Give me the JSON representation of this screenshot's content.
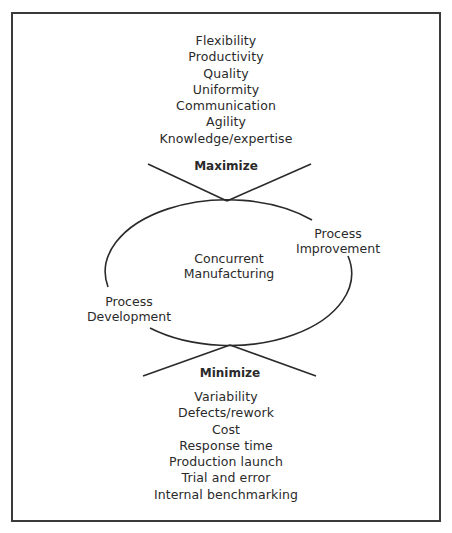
{
  "diagram": {
    "maximize_label": "Maximize",
    "minimize_label": "Minimize",
    "center": {
      "line1": "Concurrent",
      "line2": "Manufacturing"
    },
    "process_improvement": {
      "line1": "Process",
      "line2": "Improvement"
    },
    "process_development": {
      "line1": "Process",
      "line2": "Development"
    },
    "maximize_items": [
      "Flexibility",
      "Productivity",
      "Quality",
      "Uniformity",
      "Communication",
      "Agility",
      "Knowledge/expertise"
    ],
    "minimize_items": [
      "Variability",
      "Defects/rework",
      "Cost",
      "Response time",
      "Production launch",
      "Trial and error",
      "Internal benchmarking"
    ],
    "colors": {
      "line": "#2a2a2a",
      "text": "#2a2a2a",
      "frame": "#3a3a3a"
    }
  }
}
